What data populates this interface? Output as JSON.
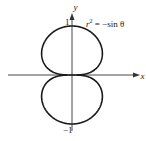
{
  "chart_data": {
    "type": "line",
    "title": "",
    "equation": "r² = −sin θ",
    "xlabel": "x",
    "ylabel": "y",
    "y_ticks": [
      {
        "value": 1,
        "label": "1"
      },
      {
        "value": -1,
        "label": "−1"
      }
    ],
    "curve": "lemniscate r^2 = -sin(theta), two lobes along the y-axis, extending from y=-1 to y=1",
    "ylim": [
      -1,
      1
    ],
    "grid": false,
    "legend": "none"
  },
  "labels": {
    "equation_r": "r",
    "equation_exp": "2",
    "equation_rest": " = −sin θ",
    "x_axis": "x",
    "y_axis": "y",
    "tick_top": "1",
    "tick_bottom": "−1"
  }
}
